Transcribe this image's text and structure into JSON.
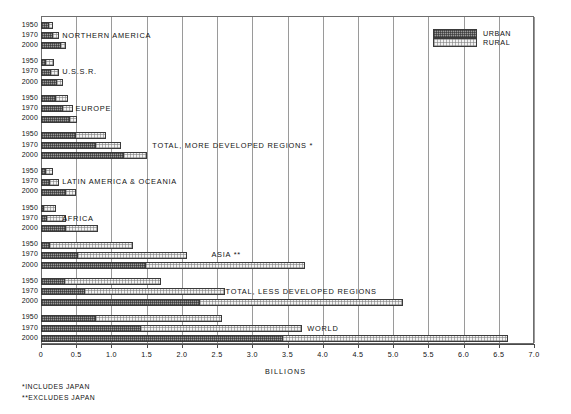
{
  "chart_data": {
    "type": "bar",
    "orientation": "horizontal",
    "stacked": true,
    "title": "",
    "xlabel": "BILLIONS",
    "ylabel": "",
    "xlim": [
      0,
      7.0
    ],
    "xticks": [
      "0",
      "0.5",
      "1.0",
      "1.5",
      "2.0",
      "2.5",
      "3.0",
      "3.5",
      "4.0",
      "4.5",
      "5.0",
      "5.5",
      "6.0",
      "6.5",
      "7.0"
    ],
    "xtick_values": [
      0,
      0.5,
      1.0,
      1.5,
      2.0,
      2.5,
      3.0,
      3.5,
      4.0,
      4.5,
      5.0,
      5.5,
      6.0,
      6.5,
      7.0
    ],
    "grid": true,
    "grid_axis": "x",
    "legend": {
      "position": "top-right",
      "entries": [
        {
          "label": "URBAN",
          "fill": "dark-stipple",
          "color": "#9b9b9b"
        },
        {
          "label": "RURAL",
          "fill": "light-stipple",
          "color": "#f2f2f2"
        }
      ]
    },
    "series": [
      {
        "name": "URBAN",
        "key": "urban"
      },
      {
        "name": "RURAL",
        "key": "rural"
      }
    ],
    "groups": [
      {
        "label": "NORTHERN AMERICA",
        "label_x": 0.3,
        "rows": [
          {
            "year": "1950",
            "urban": 0.11,
            "rural": 0.06,
            "total": 0.17
          },
          {
            "year": "1970",
            "urban": 0.17,
            "rural": 0.09,
            "total": 0.26
          },
          {
            "year": "2000",
            "urban": 0.29,
            "rural": 0.06,
            "total": 0.35
          }
        ]
      },
      {
        "label": "U.S.S.R.",
        "label_x": 0.3,
        "rows": [
          {
            "year": "1950",
            "urban": 0.07,
            "rural": 0.11,
            "total": 0.18
          },
          {
            "year": "1970",
            "urban": 0.14,
            "rural": 0.11,
            "total": 0.25
          },
          {
            "year": "2000",
            "urban": 0.23,
            "rural": 0.08,
            "total": 0.31
          }
        ]
      },
      {
        "label": "EUROPE",
        "label_x": 0.49,
        "rows": [
          {
            "year": "1950",
            "urban": 0.22,
            "rural": 0.17,
            "total": 0.39
          },
          {
            "year": "1970",
            "urban": 0.31,
            "rural": 0.15,
            "total": 0.46
          },
          {
            "year": "2000",
            "urban": 0.41,
            "rural": 0.1,
            "total": 0.51
          }
        ]
      },
      {
        "label": "TOTAL, MORE DEVELOPED REGIONS *",
        "label_x": 1.58,
        "rows": [
          {
            "year": "1950",
            "urban": 0.5,
            "rural": 0.42,
            "total": 0.92
          },
          {
            "year": "1970",
            "urban": 0.78,
            "rural": 0.36,
            "total": 1.14
          },
          {
            "year": "2000",
            "urban": 1.18,
            "rural": 0.32,
            "total": 1.5
          }
        ]
      },
      {
        "label": "LATIN AMERICA & OCEANIA",
        "label_x": 0.3,
        "rows": [
          {
            "year": "1950",
            "urban": 0.07,
            "rural": 0.1,
            "total": 0.17
          },
          {
            "year": "1970",
            "urban": 0.13,
            "rural": 0.13,
            "total": 0.26
          },
          {
            "year": "2000",
            "urban": 0.36,
            "rural": 0.14,
            "total": 0.5
          }
        ]
      },
      {
        "label": "AFRICA",
        "label_x": 0.3,
        "rows": [
          {
            "year": "1950",
            "urban": 0.04,
            "rural": 0.18,
            "total": 0.22
          },
          {
            "year": "1970",
            "urban": 0.08,
            "rural": 0.27,
            "total": 0.35
          },
          {
            "year": "2000",
            "urban": 0.35,
            "rural": 0.46,
            "total": 0.81
          }
        ]
      },
      {
        "label": "ASIA **",
        "label_x": 2.42,
        "rows": [
          {
            "year": "1950",
            "urban": 0.13,
            "rural": 1.18,
            "total": 1.31
          },
          {
            "year": "1970",
            "urban": 0.53,
            "rural": 1.55,
            "total": 2.08
          },
          {
            "year": "2000",
            "urban": 1.49,
            "rural": 2.26,
            "total": 3.75
          }
        ]
      },
      {
        "label": "TOTAL, LESS DEVELOPED REGIONS",
        "label_x": 2.62,
        "rows": [
          {
            "year": "1950",
            "urban": 0.34,
            "rural": 1.36,
            "total": 1.7
          },
          {
            "year": "1970",
            "urban": 0.62,
            "rural": 1.99,
            "total": 2.61
          },
          {
            "year": "2000",
            "urban": 2.26,
            "rural": 2.88,
            "total": 5.14
          }
        ]
      },
      {
        "label": "WORLD",
        "label_x": 3.78,
        "rows": [
          {
            "year": "1950",
            "urban": 0.78,
            "rural": 1.79,
            "total": 2.57
          },
          {
            "year": "1970",
            "urban": 1.42,
            "rural": 2.29,
            "total": 3.71
          },
          {
            "year": "2000",
            "urban": 3.44,
            "rural": 3.19,
            "total": 6.63
          }
        ]
      }
    ],
    "footnotes": [
      "*INCLUDES JAPAN",
      "**EXCLUDES JAPAN"
    ]
  }
}
